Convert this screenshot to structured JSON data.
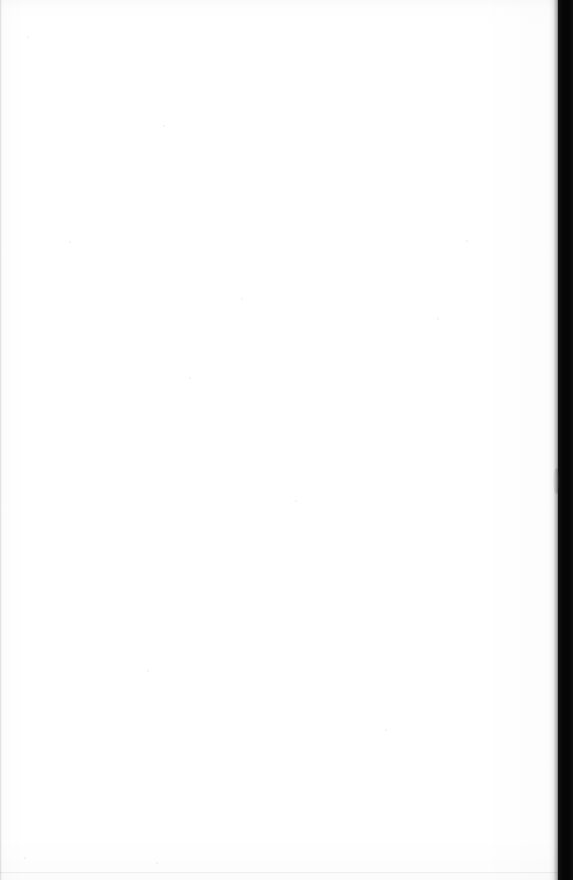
{
  "document": {
    "kind": "scanned-page",
    "content_state": "blank",
    "visible_text": "",
    "page_number_shown": "",
    "header_text": "",
    "footer_text": "",
    "body_text": ""
  },
  "canvas": {
    "width_px": 573,
    "height_px": 880,
    "background_color": "#ffffff"
  },
  "sheet": {
    "name": "page-sheet",
    "left_px": 0,
    "top_px": 0,
    "width_px": 558,
    "height_px": 880,
    "paper_color": "#ffffff"
  },
  "gutter": {
    "name": "scanner-gutter",
    "left_px": 558,
    "width_px": 15,
    "height_px": 880,
    "color": "#0a0a0a"
  },
  "edge_shadow": {
    "left_px": 549,
    "width_px": 10,
    "color": "#000000"
  },
  "artifacts": {
    "left_edge_rule": {
      "left_px": 0,
      "top_px": 0,
      "width_px": 2,
      "height_px": 880,
      "color": "#78787c"
    },
    "bottom_edge_rule": {
      "left_px": 0,
      "top_px": 872,
      "width_px": 558,
      "height_px": 2,
      "color": "#96969a"
    },
    "edge_curl": {
      "left_px": 553,
      "top_px": 468,
      "width_px": 6,
      "height_px": 26
    },
    "specks": [
      {
        "x": 27,
        "y": 36,
        "d": 2
      },
      {
        "x": 163,
        "y": 125,
        "d": 2
      },
      {
        "x": 69,
        "y": 241,
        "d": 2
      },
      {
        "x": 241,
        "y": 298,
        "d": 2
      },
      {
        "x": 189,
        "y": 377,
        "d": 2
      },
      {
        "x": 437,
        "y": 318,
        "d": 2
      },
      {
        "x": 147,
        "y": 670,
        "d": 2
      },
      {
        "x": 385,
        "y": 729,
        "d": 2
      },
      {
        "x": 24,
        "y": 857,
        "d": 2
      },
      {
        "x": 156,
        "y": 862,
        "d": 2
      },
      {
        "x": 466,
        "y": 240,
        "d": 2
      },
      {
        "x": 295,
        "y": 500,
        "d": 2
      }
    ]
  }
}
